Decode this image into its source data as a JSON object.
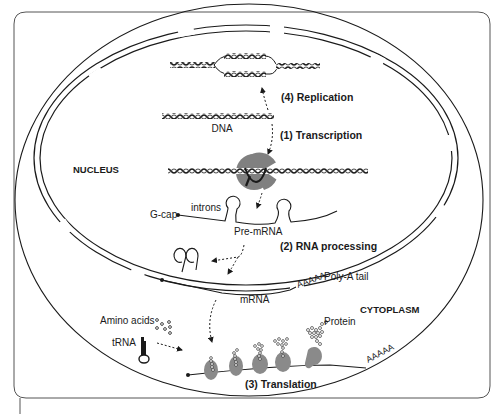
{
  "diagram": {
    "regions": {
      "nucleus": "NUCLEUS",
      "cytoplasm": "CYTOPLASM"
    },
    "steps": {
      "replication": "(4) Replication",
      "transcription": "(1) Transcription",
      "rna_processing": "(2) RNA processing",
      "translation": "(3) Translation"
    },
    "labels": {
      "dna": "DNA",
      "introns": "introns",
      "g_cap": "G-cap",
      "pre_mrna": "Pre-mRNA",
      "poly_a_seq": "AAAAA",
      "poly_a_tail": "Poly-A tail",
      "mrna": "mRNA",
      "amino_acids": "Amino acids",
      "trna": "tRNA",
      "protein": "Protein",
      "poly_a_seq_2": "AAAAA"
    },
    "colors": {
      "line": "#1a1a1a",
      "ribosome": "#8a8a8a",
      "polymerase": "#808080",
      "frame": "#555555"
    }
  }
}
